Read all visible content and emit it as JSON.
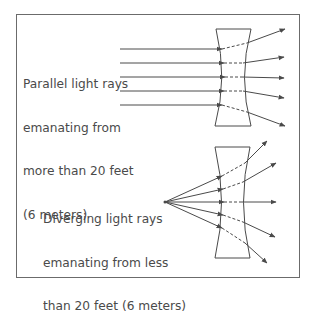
{
  "diagram": {
    "type": "optics",
    "panels": [
      {
        "id": "parallel",
        "label_lines": [
          "Parallel light rays",
          "emanating from",
          "more than 20 feet",
          "(6 meters)"
        ],
        "ray_count": 5,
        "ray_kind": "parallel",
        "lens": "concave"
      },
      {
        "id": "diverging",
        "label_lines": [
          "Diverging light rays",
          "emanating from less",
          "than 20 feet (6 meters)"
        ],
        "ray_count": 5,
        "ray_kind": "diverging from point source",
        "lens": "concave"
      }
    ],
    "colors": {
      "line": "#4a4a4a",
      "text": "#4a4a4a",
      "border": "#6b6b6b",
      "background": "#ffffff"
    }
  }
}
